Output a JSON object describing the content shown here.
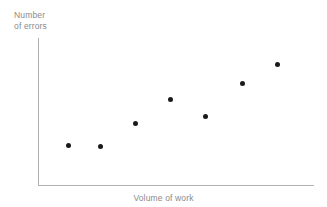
{
  "chart_data": {
    "type": "scatter",
    "title": "",
    "xlabel": "Volume of work",
    "ylabel_line1": "Number",
    "ylabel_line2": "of errors",
    "ylabel": "Number of errors",
    "grid": false,
    "legend": false,
    "tick_labels_x": [],
    "tick_labels_y": [],
    "xlim": [
      0,
      10
    ],
    "ylim": [
      0,
      10
    ],
    "marker_color": "#1a1a1a",
    "axis_color": "#b0b0b0",
    "label_color": "#8a8a8a",
    "background_color": "#ffffff",
    "series": [
      {
        "name": "observations",
        "points": [
          {
            "x": 1.1,
            "y": 2.7
          },
          {
            "x": 2.2,
            "y": 2.65
          },
          {
            "x": 3.5,
            "y": 4.2
          },
          {
            "x": 4.8,
            "y": 5.85
          },
          {
            "x": 6.1,
            "y": 4.7
          },
          {
            "x": 7.4,
            "y": 6.95
          },
          {
            "x": 8.7,
            "y": 8.25
          }
        ]
      }
    ],
    "pixel_points": [
      {
        "left": 30,
        "top": 107
      },
      {
        "left": 62,
        "top": 108
      },
      {
        "left": 97,
        "top": 85
      },
      {
        "left": 132,
        "top": 61
      },
      {
        "left": 167,
        "top": 78
      },
      {
        "left": 204,
        "top": 45
      },
      {
        "left": 239,
        "top": 26
      }
    ]
  }
}
